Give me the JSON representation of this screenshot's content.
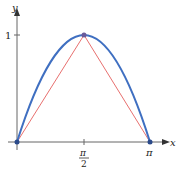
{
  "diagram": {
    "axes": {
      "x_label": "x",
      "y_label": "y",
      "y_tick_label": "1",
      "x_tick_half": {
        "num": "π",
        "den": "2"
      },
      "x_tick_end": "π"
    },
    "curves": [
      {
        "name": "sine-curve",
        "expression": "y = sin x",
        "color": "#3f6fc1"
      },
      {
        "name": "triangle",
        "points": [
          [
            0,
            0
          ],
          [
            1.5708,
            1
          ],
          [
            3.1416,
            0
          ]
        ],
        "color": "#e8706f"
      }
    ],
    "points": [
      [
        0,
        0
      ],
      [
        1.5708,
        1
      ],
      [
        3.1416,
        0
      ]
    ],
    "axis_color": "#555555"
  }
}
